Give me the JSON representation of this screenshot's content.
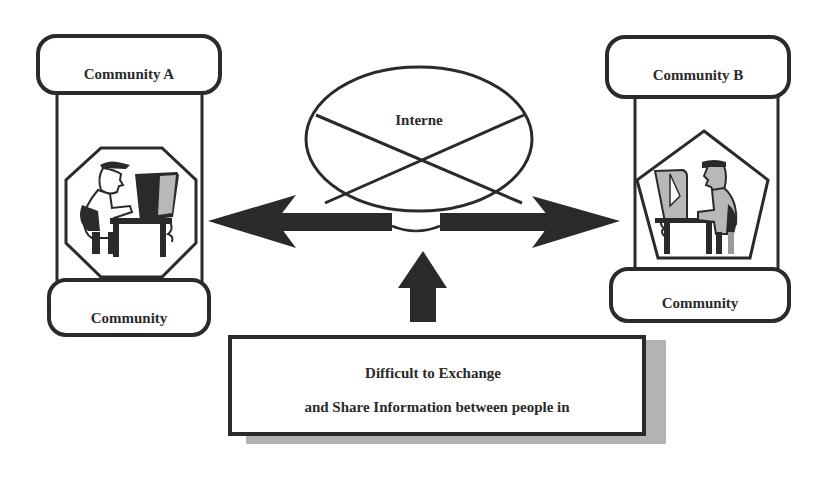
{
  "diagram": {
    "community_a": {
      "top_label": "Community A",
      "bottom_label": "Community",
      "frame_shape": "octagon",
      "icon": "person-at-computer-icon"
    },
    "community_b": {
      "top_label": "Community B",
      "bottom_label": "Community",
      "frame_shape": "pentagon",
      "icon": "person-at-computer-icon"
    },
    "internet": {
      "label": "Interne",
      "shape": "ellipse-with-cross"
    },
    "arrows": {
      "horizontal": "double-headed arrow between Community A and Community B through Internet",
      "vertical": "up arrow from message box toward Internet"
    },
    "message_box": {
      "line1": "Difficult to Exchange",
      "line2": "and Share Information between people in"
    },
    "colors": {
      "stroke": "#2a2a2a",
      "screen_gray": "#b8b8b8",
      "shadow": "#9a9a9a",
      "background": "#ffffff"
    }
  }
}
